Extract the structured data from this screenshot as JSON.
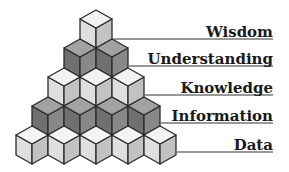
{
  "diagram": {
    "levels": [
      {
        "label": "Wisdom",
        "cubes": 1,
        "shade": "light",
        "label_x": 273,
        "line_y": 39,
        "line_x1": 113
      },
      {
        "label": "Understanding",
        "cubes": 2,
        "shade": "dark",
        "label_x": 273,
        "line_y": 66,
        "line_x1": 129
      },
      {
        "label": "Knowledge",
        "cubes": 3,
        "shade": "light",
        "label_x": 273,
        "line_y": 95,
        "line_x1": 145
      },
      {
        "label": "Information",
        "cubes": 4,
        "shade": "dark",
        "label_x": 273,
        "line_y": 123,
        "line_x1": 161
      },
      {
        "label": "Data",
        "cubes": 5,
        "shade": "light",
        "label_x": 273,
        "line_y": 152,
        "line_x1": 177
      }
    ],
    "colors": {
      "light": {
        "top": "#f3f3f3",
        "left": "#dedede",
        "right": "#c2c2c2"
      },
      "dark": {
        "top": "#a2a2a2",
        "left": "#707070",
        "right": "#888888"
      },
      "outline": "#2a2a2a",
      "line": "#333333"
    }
  }
}
